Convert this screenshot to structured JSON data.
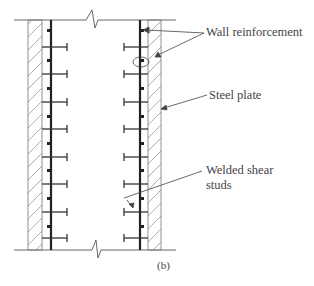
{
  "diagram": {
    "labels": {
      "wall_reinforcement": "Wall reinforcement",
      "steel_plate": "Steel plate",
      "welded_shear_studs_line1": "Welded shear",
      "welded_shear_studs_line2": "studs"
    },
    "subfigure_label": "(b)",
    "colors": {
      "line": "#333333",
      "hatch": "#888888",
      "text": "#444444"
    }
  }
}
